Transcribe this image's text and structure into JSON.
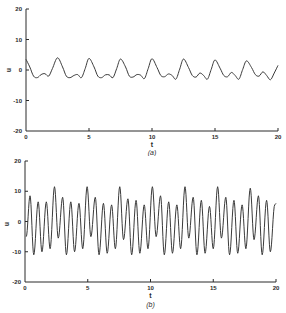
{
  "chart_data": [
    {
      "type": "line",
      "panel": "(a)",
      "caption": "(a)",
      "xlabel": "t",
      "ylabel": "u",
      "xlim": [
        0,
        20
      ],
      "ylim": [
        -20,
        20
      ],
      "xticks": [
        "0",
        "5",
        "10",
        "15",
        "20"
      ],
      "yticks": [
        "20",
        "10",
        "0",
        "-10",
        "-20"
      ],
      "grid": false,
      "legend": null,
      "description": "Periodic signal with period ~2.5, main peaks ~4, secondary small bumps ~-1 between, troughs ~-2.5",
      "series": [
        {
          "name": "u(t)",
          "x": [
            0,
            0.3,
            0.6,
            0.9,
            1.2,
            1.5,
            1.8,
            2.1,
            2.5,
            2.9,
            3.2,
            3.5,
            3.8,
            4.1,
            4.4,
            4.7,
            5.0,
            5.4,
            5.7,
            6.0,
            6.3,
            6.6,
            6.9,
            7.2,
            7.5,
            7.9,
            8.2,
            8.5,
            8.8,
            9.1,
            9.4,
            9.7,
            10.0,
            10.4,
            10.7,
            11.0,
            11.3,
            11.6,
            11.9,
            12.2,
            12.5,
            12.9,
            13.2,
            13.5,
            13.8,
            14.1,
            14.4,
            14.7,
            15.0,
            15.4,
            15.7,
            16.0,
            16.3,
            16.6,
            16.9,
            17.2,
            17.5,
            17.9,
            18.2,
            18.5,
            18.8,
            19.1,
            19.4,
            19.7,
            20.0
          ],
          "y": [
            3.5,
            1.0,
            -2.0,
            -2.5,
            -1.5,
            -1.2,
            -2.0,
            0.5,
            4.0,
            1.0,
            -2.0,
            -2.5,
            -1.8,
            -1.5,
            -2.5,
            0.5,
            3.8,
            1.0,
            -2.0,
            -2.5,
            -1.6,
            -1.6,
            -2.5,
            0.5,
            3.6,
            1.0,
            -2.0,
            -2.3,
            -1.5,
            -1.7,
            -2.8,
            0.5,
            3.7,
            0.8,
            -1.8,
            -2.2,
            -1.3,
            -1.8,
            -3.0,
            0.3,
            3.6,
            0.8,
            -1.8,
            -2.3,
            -1.0,
            -1.8,
            -3.0,
            0.2,
            3.3,
            0.6,
            -1.8,
            -2.2,
            -0.8,
            -1.8,
            -3.0,
            0.2,
            3.0,
            0.8,
            -1.5,
            -2.0,
            -0.6,
            -1.8,
            -3.2,
            -1.0,
            1.5
          ]
        }
      ]
    },
    {
      "type": "line",
      "panel": "(b)",
      "caption": "(b)",
      "xlabel": "t",
      "ylabel": "u",
      "xlim": [
        0,
        20
      ],
      "ylim": [
        -20,
        20
      ],
      "xticks": [
        "0",
        "5",
        "10",
        "15",
        "20"
      ],
      "yticks": [
        "20",
        "10",
        "0",
        "-10",
        "-20"
      ],
      "grid": false,
      "legend": null,
      "description": "Fast oscillation (~32 cycles over t=0..20) with amplitude modulation; peaks between ~6 and ~11, troughs between ~-6 and ~-11",
      "series": [
        {
          "name": "u(t)",
          "peaks_t": [
            0.4,
            1.05,
            1.7,
            2.35,
            3.0,
            3.65,
            4.3,
            4.95,
            5.6,
            6.25,
            6.9,
            7.55,
            8.2,
            8.85,
            9.5,
            10.15,
            10.8,
            11.45,
            12.1,
            12.75,
            13.4,
            14.05,
            14.7,
            15.35,
            16.0,
            16.65,
            17.3,
            17.95,
            18.6,
            19.25,
            19.9
          ],
          "peaks_u": [
            8.5,
            6.5,
            6.5,
            11.5,
            8.0,
            6.5,
            6.0,
            11.5,
            8.0,
            6.0,
            5.5,
            11.5,
            7.5,
            7.0,
            5.5,
            11.5,
            8.5,
            6.5,
            5.5,
            11.5,
            8.0,
            7.0,
            5.0,
            11.5,
            8.0,
            7.0,
            5.5,
            11.0,
            8.5,
            7.0,
            5.5
          ],
          "troughs_t": [
            0.1,
            0.7,
            1.35,
            2.0,
            2.65,
            3.3,
            3.95,
            4.6,
            5.25,
            5.9,
            6.55,
            7.2,
            7.85,
            8.5,
            9.15,
            9.8,
            10.45,
            11.1,
            11.75,
            12.4,
            13.05,
            13.7,
            14.35,
            15.0,
            15.65,
            16.3,
            16.95,
            17.6,
            18.25,
            18.9,
            19.55
          ],
          "troughs_u": [
            -5.0,
            -11.0,
            -10.0,
            -9.0,
            -5.5,
            -11.0,
            -10.0,
            -9.0,
            -5.0,
            -11.0,
            -10.5,
            -9.0,
            -6.0,
            -11.0,
            -10.5,
            -9.0,
            -5.0,
            -11.0,
            -10.5,
            -9.0,
            -5.5,
            -11.0,
            -10.5,
            -9.0,
            -5.5,
            -11.0,
            -10.5,
            -9.0,
            -6.0,
            -11.0,
            -10.0
          ]
        }
      ]
    }
  ],
  "panels": {
    "a": {
      "caption": "(a)",
      "xlabel": "t",
      "ylabel": "u",
      "yticks": [
        "20",
        "10",
        "0",
        "-10",
        "-20"
      ],
      "xticks": [
        "0",
        "5",
        "10",
        "15",
        "20"
      ]
    },
    "b": {
      "caption": "(b)",
      "xlabel": "t",
      "ylabel": "u",
      "yticks": [
        "20",
        "10",
        "0",
        "-10",
        "-20"
      ],
      "xticks": [
        "0",
        "5",
        "10",
        "15",
        "20"
      ]
    }
  },
  "colors": {
    "line": "#3a3a3a",
    "axis": "#2a2a2a",
    "background": "#ffffff"
  }
}
